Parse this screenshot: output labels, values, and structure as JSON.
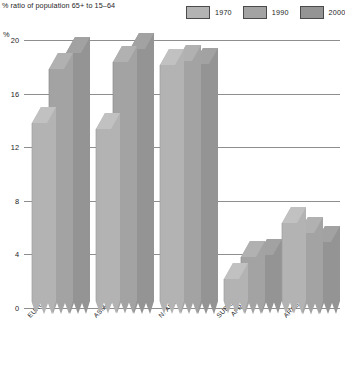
{
  "chart_data": {
    "type": "bar",
    "title": "% ratio of population 65+ to 15–64",
    "xlabel": "",
    "ylabel": "%",
    "ylim": [
      0,
      20
    ],
    "yticks": [
      0,
      4,
      8,
      12,
      16,
      20
    ],
    "grid": true,
    "legend_position": "top-right",
    "categories": [
      "EUROPE/USSR",
      "ASIA/OCEANIA",
      "N. AMERICA",
      "SUB-SAHARAN AFRICA",
      "ARAB STATES"
    ],
    "series": [
      {
        "name": "1970",
        "color": "#b3b3b3",
        "values": [
          14.5,
          14.0,
          18.8,
          2.8,
          7.0
        ]
      },
      {
        "name": "1990",
        "color": "#a3a3a3",
        "values": [
          18.5,
          19.0,
          19.1,
          4.5,
          6.3
        ]
      },
      {
        "name": "2000",
        "color": "#949494",
        "values": [
          19.7,
          20.0,
          18.9,
          4.6,
          5.6
        ]
      }
    ]
  },
  "header": {
    "title": "% ratio of population 65+ to 15–64"
  },
  "legend": {
    "items": [
      {
        "label": "1970"
      },
      {
        "label": "1990"
      },
      {
        "label": "2000"
      }
    ]
  },
  "axis": {
    "unit_label": "%",
    "ticks": [
      {
        "label": "20"
      },
      {
        "label": "16"
      },
      {
        "label": "12"
      },
      {
        "label": "8"
      },
      {
        "label": "4"
      },
      {
        "label": "0"
      }
    ]
  },
  "xlabels": [
    {
      "line1": "EUROPE/USSR",
      "line2": ""
    },
    {
      "line1": "ASIA/OCEANIA",
      "line2": ""
    },
    {
      "line1": "N. AMERICA",
      "line2": ""
    },
    {
      "line1": "SUB-SAHARAN",
      "line2": "AFRICA"
    },
    {
      "line1": "ARAB STATES",
      "line2": ""
    }
  ]
}
